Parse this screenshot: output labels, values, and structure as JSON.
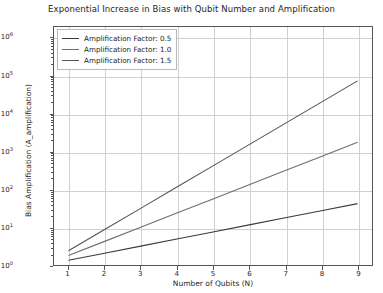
{
  "chart_data": {
    "type": "line",
    "title": "Exponential Increase in Bias with Qubit Number and Amplification",
    "xlabel": "Number of Qubits (N)",
    "ylabel": "Bias Amplification (A_amplification)",
    "yscale": "log",
    "xscale": "linear",
    "grid": true,
    "legend_position": "upper left",
    "xlim": [
      0.6,
      9.4
    ],
    "ylim": [
      1.0,
      2000000.0
    ],
    "x": [
      1,
      2,
      3,
      4,
      5,
      6,
      7,
      8,
      9
    ],
    "xticks": [
      "1",
      "2",
      "3",
      "4",
      "5",
      "6",
      "7",
      "8",
      "9"
    ],
    "yticks": [
      "10⁰",
      "10¹",
      "10²",
      "10³",
      "10⁴",
      "10⁵",
      "10⁶"
    ],
    "ytick_exponents": [
      0,
      1,
      2,
      3,
      4,
      5,
      6
    ],
    "series": [
      {
        "name": "Amplification Factor: 0.5",
        "color": "#3a3a3a",
        "values": [
          1.33,
          2.05,
          3.16,
          4.87,
          7.5,
          11.55,
          17.8,
          27.4,
          42.2
        ]
      },
      {
        "name": "Amplification Factor: 1.0",
        "color": "#6e6e6e",
        "values": [
          1.78,
          4.22,
          10.0,
          23.7,
          56.2,
          133.4,
          316.2,
          749.9,
          1778.3
        ]
      },
      {
        "name": "Amplification Factor: 1.5",
        "color": "#545454",
        "values": [
          2.37,
          8.66,
          31.6,
          115.5,
          421.7,
          1539.9,
          5623.4,
          20535.3,
          74989.4
        ]
      }
    ]
  },
  "legend": {
    "entries": [
      "Amplification Factor: 0.5",
      "Amplification Factor: 1.0",
      "Amplification Factor: 1.5"
    ]
  },
  "colors": {
    "axis": "#555555",
    "grid": "#d0d0d0",
    "text": "#262626",
    "background": "#ffffff"
  }
}
